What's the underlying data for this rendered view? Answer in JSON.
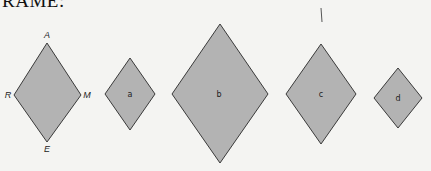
{
  "heading": "RAME:",
  "colors": {
    "fill": "#b3b3b3",
    "stroke": "#3a3a3a",
    "background": "#f4f4f2"
  },
  "reference_shape": {
    "name": "RAME",
    "vertices": {
      "A": "A",
      "R": "R",
      "M": "M",
      "E": "E"
    }
  },
  "shapes": [
    {
      "label": "a"
    },
    {
      "label": "b"
    },
    {
      "label": "c"
    },
    {
      "label": "d"
    }
  ]
}
